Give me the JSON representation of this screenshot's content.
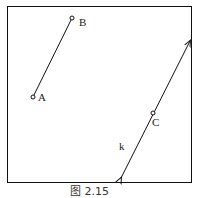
{
  "figure": {
    "caption": "图 2.15",
    "points": [
      {
        "name": "A",
        "x": 33,
        "y": 97
      },
      {
        "name": "B",
        "x": 72,
        "y": 18
      },
      {
        "name": "C",
        "x": 153,
        "y": 113
      }
    ],
    "segment": {
      "from": "A",
      "to": "B"
    },
    "line": {
      "label": "k",
      "through": "C",
      "x1": 121,
      "y1": 178,
      "x2": 190,
      "y2": 41
    }
  }
}
